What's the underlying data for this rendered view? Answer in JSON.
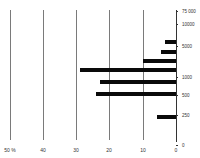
{
  "chart_data": {
    "type": "bar",
    "orientation": "horizontal",
    "title": "",
    "xlabel": "%",
    "ylabel": "",
    "x_ticks": [
      "50 %",
      "40",
      "30",
      "20",
      "10",
      "0"
    ],
    "x_direction": "reversed (0 on right, 50% on left)",
    "xlim": [
      0,
      50
    ],
    "y_ticks": [
      "75 000",
      "10000",
      "5000",
      "1000",
      "500",
      "250",
      "0"
    ],
    "grid": true,
    "bars": [
      {
        "y": 42,
        "value": 3.3
      },
      {
        "y": 52,
        "value": 4.5
      },
      {
        "y": 61,
        "value": 10
      },
      {
        "y": 70,
        "value": 28.8
      },
      {
        "y": 82,
        "value": 23
      },
      {
        "y": 94,
        "value": 24
      },
      {
        "y": 117,
        "value": 5.7
      }
    ]
  },
  "x_labels": [
    {
      "text": "50 %",
      "x": 10
    },
    {
      "text": "40",
      "x": 43
    },
    {
      "text": "30",
      "x": 76
    },
    {
      "text": "20",
      "x": 109
    },
    {
      "text": "10",
      "x": 143
    },
    {
      "text": "0",
      "x": 176
    }
  ],
  "y_labels": [
    {
      "text": "75 000",
      "y": 11
    },
    {
      "text": "10000",
      "y": 24
    },
    {
      "text": "5000",
      "y": 46
    },
    {
      "text": "1000",
      "y": 77
    },
    {
      "text": "500",
      "y": 95
    },
    {
      "text": "250",
      "y": 115
    },
    {
      "text": "0",
      "y": 145
    }
  ]
}
